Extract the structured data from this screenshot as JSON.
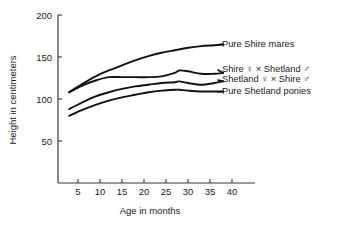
{
  "chart_data": {
    "type": "line",
    "title": "",
    "xlabel": "Age in months",
    "ylabel": "Height in centimeters",
    "xlim": [
      0,
      42
    ],
    "ylim": [
      0,
      200
    ],
    "xticks": [
      5,
      10,
      15,
      20,
      25,
      30,
      35,
      40
    ],
    "yticks": [
      50,
      100,
      150,
      200
    ],
    "grid": false,
    "legend_position": "right-inline-labels",
    "x": [
      3,
      6,
      9,
      12,
      15,
      18,
      21,
      24,
      27,
      28,
      30,
      33,
      36,
      38
    ],
    "series": [
      {
        "name": "Pure Shire mares",
        "label": "Pure Shire mares",
        "values": [
          108,
          118,
          127,
          134,
          140,
          146,
          151,
          155,
          158,
          159,
          161,
          163,
          164,
          165
        ]
      },
      {
        "name": "Shire female x Shetland male",
        "label": "Shire ♀ × Shetland ♂",
        "values": [
          108,
          116,
          122,
          126,
          126,
          126,
          126,
          127,
          131,
          134,
          133,
          130,
          130,
          131
        ]
      },
      {
        "name": "Shetland female x Shire male",
        "label": "Shetland ♀ × Shire ♂",
        "values": [
          88,
          96,
          103,
          108,
          112,
          115,
          117,
          119,
          120,
          121,
          119,
          117,
          119,
          121
        ]
      },
      {
        "name": "Pure Shetland ponies",
        "label": "Pure Shetland ponies",
        "values": [
          80,
          87,
          93,
          98,
          102,
          105,
          108,
          110,
          111,
          111,
          110,
          109,
          109,
          109
        ]
      }
    ]
  },
  "colors": {
    "line": "#111111",
    "axis": "#3a3a3a",
    "background": "#ffffff",
    "text": "#1a1a1a"
  }
}
